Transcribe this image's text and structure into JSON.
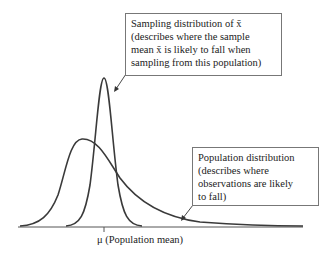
{
  "diagram": {
    "sampling_box": {
      "lines": [
        "Sampling distribution of x̄",
        "(describes where the sample",
        "mean x̄ is likely to fall when",
        "sampling from this population)"
      ]
    },
    "population_box": {
      "lines": [
        "Population distribution",
        "(describes where",
        "observations are likely",
        "to fall)"
      ]
    },
    "axis_label": "μ (Population mean)",
    "colors": {
      "curve": "#3a3a3a",
      "box_border": "#777777"
    }
  }
}
